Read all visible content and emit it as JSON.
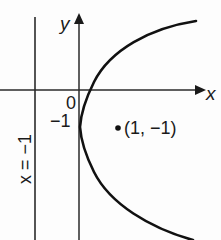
{
  "diagram": {
    "type": "parabola-graph",
    "equation_implied": "(y+1)^2 = 4x",
    "axes": {
      "x_label": "x",
      "y_label": "y",
      "origin_label": "0"
    },
    "ticks": {
      "y_minus_one": "−1"
    },
    "directrix": {
      "label": "x = −1",
      "x_value": -1
    },
    "vertex": {
      "x": 0,
      "y": -1
    },
    "focus": {
      "x": 1,
      "y": -1,
      "label": "(1, −1)"
    },
    "colors": {
      "ink": "#1a1a1a",
      "background": "#fdfdfd"
    }
  }
}
